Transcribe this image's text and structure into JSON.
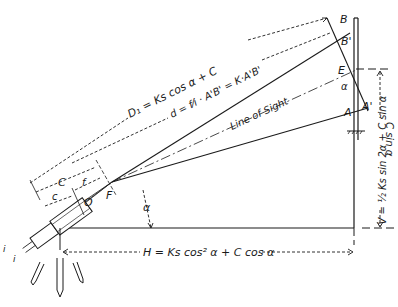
{
  "diagram": {
    "points": {
      "B": "B",
      "B_prime": "B'",
      "E": "E",
      "A": "A",
      "A_prime": "A'",
      "F": "F",
      "O": "O"
    },
    "labels": {
      "line_of_sight": "Line of Sight",
      "alpha_at_F": "α",
      "alpha_at_E": "α",
      "C": "C",
      "c": "c",
      "f": "f",
      "i_top": "i",
      "i_bottom": "i"
    },
    "formulas": {
      "D1": "D₁ = Ks cos α + C",
      "d": "d = f⁄i · A'B' = K·A'B'",
      "H": "H = Ks cos² α + C cos α",
      "V": "V = ½ Ks sin 2α + C sin α",
      "C_sin_alpha": "C sin α"
    },
    "colors": {
      "ink": "#1a1a1a",
      "background": "#ffffff"
    }
  }
}
